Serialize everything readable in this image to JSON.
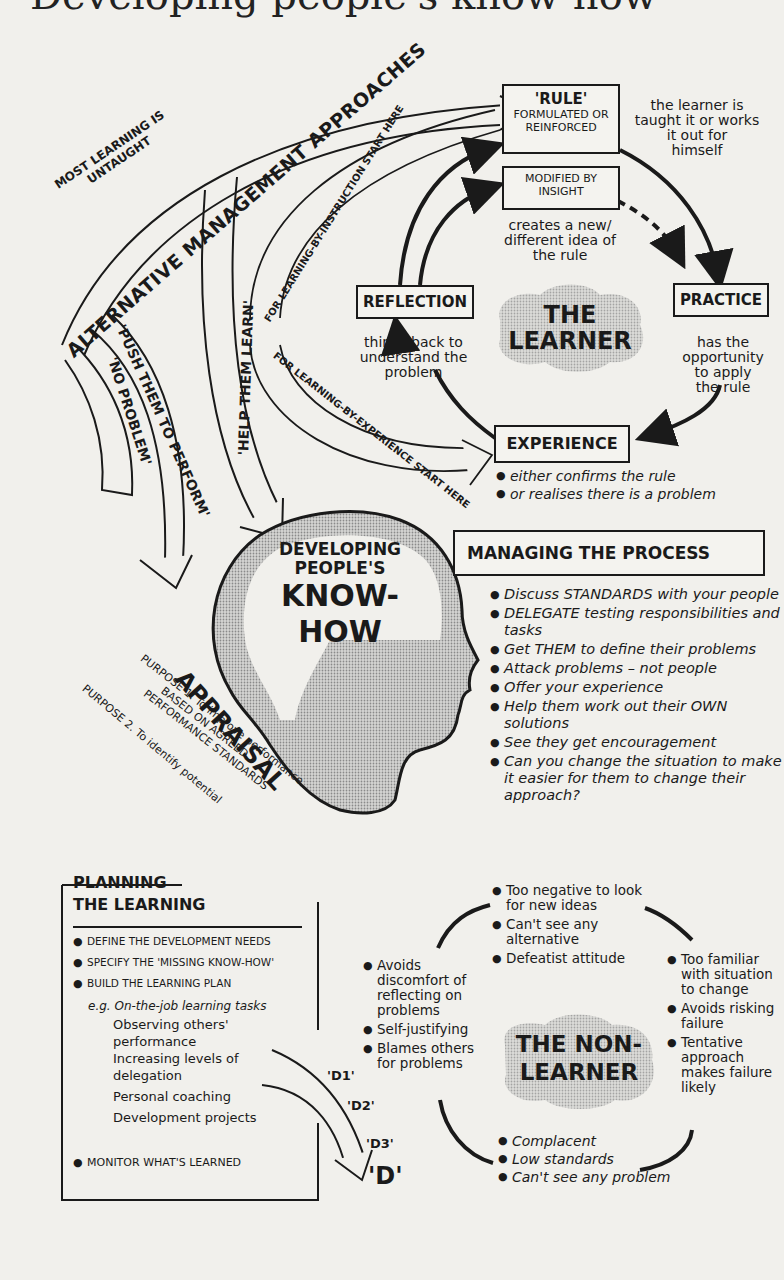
{
  "title": "Developing people's know-how",
  "colors": {
    "background": "#f1f0ec",
    "ink": "#1a1a1a",
    "screen_tone": "#bdbdbd"
  },
  "top_left": {
    "note": "MOST LEARNING IS UNTAUGHT",
    "note_line1": "MOST LEARNING IS",
    "note_line2": "UNTAUGHT",
    "banner": "ALTERNATIVE MANAGEMENT APPROACHES",
    "approaches": [
      {
        "label": "'NO PROBLEM'"
      },
      {
        "label": "'PUSH THEM TO PERFORM'"
      },
      {
        "label": "'HELP THEM LEARN'"
      }
    ],
    "instruction_arrow": "FOR LEARNING-BY-INSTRUCTION START HERE",
    "experience_arrow": "FOR LEARNING-BY-EXPERIENCE START HERE"
  },
  "learner_cycle": {
    "center": {
      "line1": "THE",
      "line2": "LEARNER"
    },
    "rule": {
      "title": "'RULE'",
      "sub1": "FORMULATED OR",
      "sub2": "REINFORCED",
      "note_lines": [
        "the learner is",
        "taught it or works",
        "it out for",
        "himself"
      ]
    },
    "modified": {
      "line1": "MODIFIED BY",
      "line2": "INSIGHT",
      "note_lines": [
        "creates a new/",
        "different idea of",
        "the rule"
      ]
    },
    "practice": {
      "title": "PRACTICE",
      "note_lines": [
        "has the",
        "opportunity",
        "to apply",
        "the rule"
      ]
    },
    "reflection": {
      "title": "REFLECTION",
      "note_lines": [
        "thinks back to",
        "understand the",
        "problem"
      ]
    },
    "experience": {
      "title": "EXPERIENCE",
      "bullets": [
        "either confirms the rule",
        "or realises there is a problem"
      ]
    }
  },
  "head": {
    "line1": "DEVELOPING",
    "line2": "PEOPLE'S",
    "line3": "KNOW-HOW"
  },
  "managing": {
    "title": "MANAGING THE PROCESS",
    "bullets": [
      "Discuss STANDARDS with your people",
      "DELEGATE testing responsibilities and tasks",
      "Get THEM to define their problems",
      "Attack problems – not people",
      "Offer your experience",
      "Help them work out their OWN solutions",
      "See they get encouragement",
      "Can you change the situation to make it easier for them to change their approach?"
    ]
  },
  "appraisal": {
    "title": "APPRAISAL",
    "purpose1_line1": "PURPOSE 1. To improve performance",
    "purpose1_line2": "BASED ON AGREED",
    "purpose1_line3": "PERFORMANCE STANDARDS",
    "purpose2": "PURPOSE 2. To identify potential"
  },
  "planning": {
    "title_line1": "PLANNING",
    "title_line2": "THE LEARNING",
    "bullets": [
      "DEFINE THE DEVELOPMENT NEEDS",
      "SPECIFY THE 'MISSING KNOW-HOW'",
      "BUILD THE LEARNING PLAN"
    ],
    "eg_label": "e.g. On-the-job learning tasks",
    "tasks": [
      "Observing others' performance",
      "Increasing levels of delegation",
      "Personal coaching",
      "Development projects"
    ],
    "monitor": "MONITOR WHAT'S LEARNED",
    "d_labels": [
      "'D1'",
      "'D2'",
      "'D3'",
      "'D'"
    ]
  },
  "non_learner": {
    "center": {
      "line1": "THE NON-",
      "line2": "LEARNER"
    },
    "top_bullets": [
      "Too negative to look for new ideas",
      "Can't see any alternative",
      "Defeatist attitude"
    ],
    "left_bullets": [
      "Avoids discomfort of reflecting on problems",
      "Self-justifying",
      "Blames others for problems"
    ],
    "right_bullets": [
      "Too familiar with situation to change",
      "Avoids risking failure",
      "Tentative approach makes failure likely"
    ],
    "bottom_bullets": [
      "Complacent",
      "Low standards",
      "Can't see any problem"
    ]
  }
}
